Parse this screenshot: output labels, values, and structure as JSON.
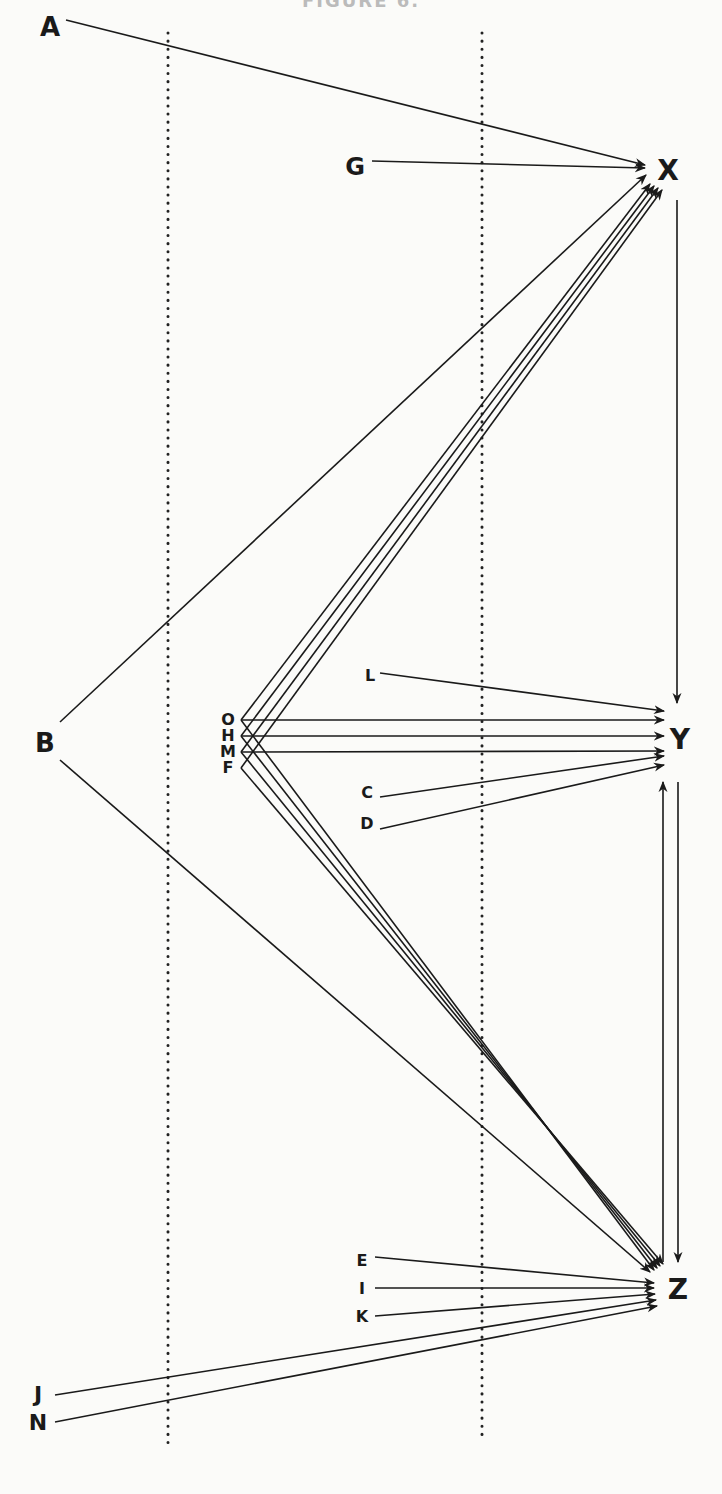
{
  "caption": "FIGURE 6.",
  "colors": {
    "ink": "#1a1a1a",
    "background": "#fbfbf9",
    "divider": "#222222"
  },
  "dividers": [
    {
      "id": "left",
      "x": 168,
      "y1": 33,
      "y2": 1450
    },
    {
      "id": "right",
      "x": 482,
      "y1": 33,
      "y2": 1438
    }
  ],
  "nodes": {
    "A": {
      "label": "A",
      "x": 50,
      "y": 28,
      "size": 26
    },
    "G": {
      "label": "G",
      "x": 355,
      "y": 168,
      "size": 24
    },
    "X": {
      "label": "X",
      "x": 668,
      "y": 172,
      "size": 28
    },
    "B": {
      "label": "B",
      "x": 45,
      "y": 744,
      "size": 26
    },
    "O": {
      "label": "O",
      "x": 228,
      "y": 720,
      "size": 16
    },
    "H": {
      "label": "H",
      "x": 228,
      "y": 736,
      "size": 16
    },
    "M": {
      "label": "M",
      "x": 228,
      "y": 752,
      "size": 16
    },
    "F": {
      "label": "F",
      "x": 228,
      "y": 768,
      "size": 16
    },
    "L": {
      "label": "L",
      "x": 370,
      "y": 676,
      "size": 16
    },
    "C": {
      "label": "C",
      "x": 367,
      "y": 793,
      "size": 16
    },
    "D": {
      "label": "D",
      "x": 367,
      "y": 824,
      "size": 16
    },
    "Y": {
      "label": "Y",
      "x": 680,
      "y": 741,
      "size": 28
    },
    "E": {
      "label": "E",
      "x": 362,
      "y": 1261,
      "size": 16
    },
    "I": {
      "label": "I",
      "x": 362,
      "y": 1289,
      "size": 16
    },
    "K": {
      "label": "K",
      "x": 362,
      "y": 1317,
      "size": 16
    },
    "J": {
      "label": "J",
      "x": 38,
      "y": 1396,
      "size": 22
    },
    "N": {
      "label": "N",
      "x": 38,
      "y": 1424,
      "size": 22
    },
    "Z": {
      "label": "Z",
      "x": 678,
      "y": 1291,
      "size": 28
    }
  },
  "edges": [
    {
      "from": "A",
      "to": "X",
      "x1": 66,
      "y1": 20,
      "x2": 645,
      "y2": 165,
      "arrow": true
    },
    {
      "from": "G",
      "to": "X",
      "x1": 372,
      "y1": 161,
      "x2": 645,
      "y2": 168,
      "arrow": true
    },
    {
      "from": "B",
      "to": "X",
      "x1": 60,
      "y1": 722,
      "x2": 646,
      "y2": 175,
      "arrow": true
    },
    {
      "from": "O",
      "to": "X",
      "x1": 241,
      "y1": 720,
      "x2": 650,
      "y2": 184,
      "arrow": true
    },
    {
      "from": "H",
      "to": "X",
      "x1": 241,
      "y1": 736,
      "x2": 654,
      "y2": 186,
      "arrow": true
    },
    {
      "from": "M",
      "to": "X",
      "x1": 241,
      "y1": 752,
      "x2": 658,
      "y2": 188,
      "arrow": true
    },
    {
      "from": "F",
      "to": "X",
      "x1": 241,
      "y1": 768,
      "x2": 662,
      "y2": 190,
      "arrow": true
    },
    {
      "from": "X",
      "to": "Y",
      "x1": 677,
      "y1": 200,
      "x2": 677,
      "y2": 703,
      "arrow": true
    },
    {
      "from": "L",
      "to": "Y",
      "x1": 380,
      "y1": 673,
      "x2": 664,
      "y2": 711,
      "arrow": true
    },
    {
      "from": "O",
      "to": "Y",
      "x1": 241,
      "y1": 720,
      "x2": 664,
      "y2": 720,
      "arrow": true
    },
    {
      "from": "H",
      "to": "Y",
      "x1": 241,
      "y1": 736,
      "x2": 664,
      "y2": 736,
      "arrow": true
    },
    {
      "from": "M",
      "to": "Y",
      "x1": 241,
      "y1": 752,
      "x2": 664,
      "y2": 751,
      "arrow": true
    },
    {
      "from": "C",
      "to": "Y",
      "x1": 380,
      "y1": 797,
      "x2": 664,
      "y2": 756,
      "arrow": true
    },
    {
      "from": "D",
      "to": "Y",
      "x1": 380,
      "y1": 829,
      "x2": 664,
      "y2": 765,
      "arrow": true
    },
    {
      "from": "Z",
      "to": "Y",
      "x1": 663,
      "y1": 1262,
      "x2": 663,
      "y2": 782,
      "arrow": true
    },
    {
      "from": "Y",
      "to": "Z",
      "x1": 678,
      "y1": 782,
      "x2": 678,
      "y2": 1262,
      "arrow": true
    },
    {
      "from": "B",
      "to": "Z",
      "x1": 60,
      "y1": 760,
      "x2": 650,
      "y2": 1272,
      "arrow": true
    },
    {
      "from": "O",
      "to": "Z",
      "x1": 241,
      "y1": 720,
      "x2": 654,
      "y2": 1270,
      "arrow": true
    },
    {
      "from": "H",
      "to": "Z",
      "x1": 241,
      "y1": 736,
      "x2": 657,
      "y2": 1268,
      "arrow": true
    },
    {
      "from": "M",
      "to": "Z",
      "x1": 241,
      "y1": 752,
      "x2": 660,
      "y2": 1266,
      "arrow": true
    },
    {
      "from": "F",
      "to": "Z",
      "x1": 241,
      "y1": 768,
      "x2": 663,
      "y2": 1264,
      "arrow": true
    },
    {
      "from": "E",
      "to": "Z",
      "x1": 375,
      "y1": 1257,
      "x2": 654,
      "y2": 1283,
      "arrow": true
    },
    {
      "from": "I",
      "to": "Z",
      "x1": 375,
      "y1": 1288,
      "x2": 654,
      "y2": 1288,
      "arrow": true
    },
    {
      "from": "K",
      "to": "Z",
      "x1": 375,
      "y1": 1316,
      "x2": 655,
      "y2": 1294,
      "arrow": true
    },
    {
      "from": "J",
      "to": "Z",
      "x1": 55,
      "y1": 1395,
      "x2": 656,
      "y2": 1300,
      "arrow": true
    },
    {
      "from": "N",
      "to": "Z",
      "x1": 55,
      "y1": 1422,
      "x2": 657,
      "y2": 1306,
      "arrow": true
    }
  ]
}
